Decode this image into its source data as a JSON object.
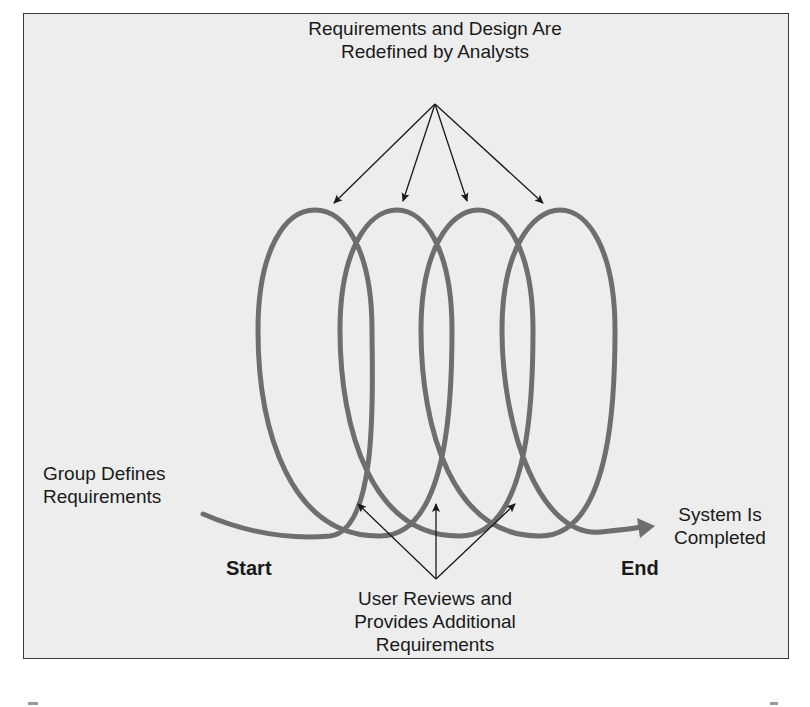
{
  "diagram": {
    "labels": {
      "top": [
        "Requirements and Design Are",
        "Redefined by Analysts"
      ],
      "left": [
        "Group Defines",
        "Requirements"
      ],
      "right": [
        "System Is",
        "Completed"
      ],
      "bottom": [
        "User Reviews and",
        "Provides Additional",
        "Requirements"
      ],
      "start": "Start",
      "end": "End"
    },
    "loop_count": 4,
    "colors": {
      "background": "#ededed",
      "loop": "#6e6e6e",
      "arrow": "#1a1a1a",
      "border": "#3a3a3a"
    }
  }
}
